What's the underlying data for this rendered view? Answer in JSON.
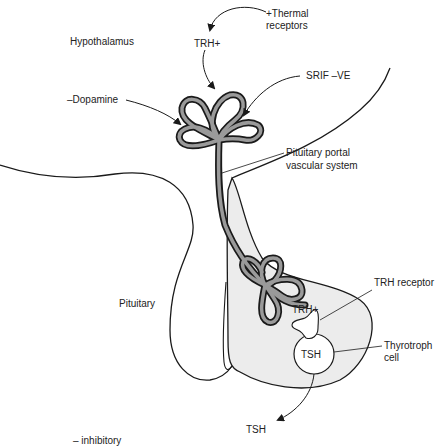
{
  "diagram": {
    "labels": {
      "hypothalamus": "Hypothalamus",
      "trh_top": "TRH+",
      "thermal_line1": "+Thermal",
      "thermal_line2": "receptors",
      "dopamine": "–Dopamine",
      "srif": "SRIF –VE",
      "portal_line1": "Pituitary portal",
      "portal_line2": "vascular system",
      "pituitary": "Pituitary",
      "trh_receptor": "TRH receptor",
      "trh_cell": "TRH+",
      "tsh_cell": "TSH",
      "thyrotroph_line1": "Thyrotroph",
      "thyrotroph_line2": "cell",
      "tsh_out": "TSH",
      "legend": "– inhibitory"
    },
    "colors": {
      "outline": "#1a1a1a",
      "vessel_fill": "#9a9a9a",
      "gland_fill": "#ececec",
      "background": "#ffffff"
    }
  }
}
